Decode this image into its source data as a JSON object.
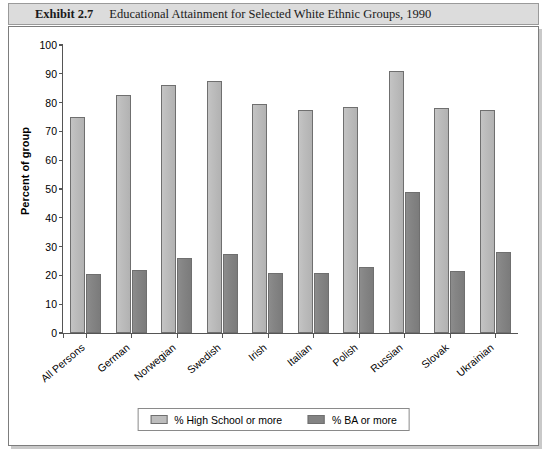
{
  "exhibit": {
    "number": "Exhibit 2.7",
    "title": "Educational Attainment for Selected White Ethnic Groups, 1990"
  },
  "chart_data": {
    "type": "bar",
    "title": "Educational Attainment for Selected White Ethnic Groups, 1990",
    "xlabel": "",
    "ylabel": "Percent of group",
    "ylim": [
      0,
      100
    ],
    "ytick_labels": [
      "0",
      "10",
      "20",
      "30",
      "40",
      "50",
      "60",
      "70",
      "80",
      "90",
      "100"
    ],
    "yticks": [
      0,
      10,
      20,
      30,
      40,
      50,
      60,
      70,
      80,
      90,
      100
    ],
    "grid": false,
    "legend_position": "bottom-center",
    "categories": [
      "All Persons",
      "German",
      "Norwegian",
      "Swedish",
      "Irish",
      "Italian",
      "Polish",
      "Russian",
      "Slovak",
      "Ukrainian"
    ],
    "series": [
      {
        "name": "% High School or more",
        "color": "#bdbdbd",
        "values": [
          75,
          82.5,
          86,
          87.5,
          79.5,
          77.5,
          78.5,
          91,
          78,
          77.5
        ]
      },
      {
        "name": "% BA or more",
        "color": "#838383",
        "values": [
          20.5,
          22,
          26,
          27.5,
          21,
          21,
          23,
          49,
          21.5,
          28
        ]
      }
    ]
  }
}
